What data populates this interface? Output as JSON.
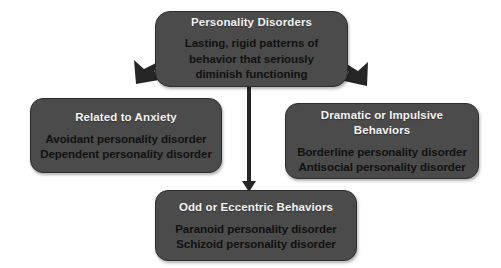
{
  "diagram": {
    "background_color": "#ffffff",
    "node_fill_color": "#4b4b4b",
    "node_border_color": "#2e2e2e",
    "heading_text_color": "#f2f2f2",
    "body_text_color": "#111111",
    "arrow_color": "#262626"
  },
  "root": {
    "heading": "Personality Disorders",
    "body_lines": [
      "Lasting, rigid patterns of",
      "behavior that seriously",
      "diminish functioning"
    ]
  },
  "branches": [
    {
      "id": "anxiety",
      "heading": "Related to Anxiety",
      "body_lines": [
        "Avoidant personality disorder",
        "Dependent personality disorder"
      ]
    },
    {
      "id": "odd",
      "heading": "Odd or Eccentric Behaviors",
      "body_lines": [
        "Paranoid personality disorder",
        "Schizoid personality disorder"
      ]
    },
    {
      "id": "dramatic",
      "heading": "Dramatic or Impulsive Behaviors",
      "body_lines": [
        "Borderline personality disorder",
        "Antisocial personality disorder"
      ]
    }
  ],
  "connectors": [
    {
      "id": "root-to-anxiety",
      "kind": "thick-diagonal-arrow",
      "direction": "down-left"
    },
    {
      "id": "root-to-odd",
      "kind": "thin-vertical-arrow",
      "direction": "down"
    },
    {
      "id": "root-to-dramatic",
      "kind": "thick-diagonal-arrow",
      "direction": "down-right"
    }
  ]
}
